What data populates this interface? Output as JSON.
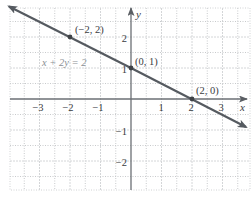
{
  "chart_data": {
    "type": "line",
    "title": "",
    "xlabel": "x",
    "ylabel": "y",
    "xlim": [
      -4,
      4
    ],
    "ylim": [
      -3,
      3
    ],
    "grid": true,
    "x_ticks": [
      -3,
      -2,
      -1,
      1,
      2,
      3
    ],
    "y_ticks": [
      2,
      1,
      -1,
      -2
    ],
    "x_tick_labels": [
      "−3",
      "−2",
      "−1",
      "1",
      "2",
      "3"
    ],
    "y_tick_labels": [
      "2",
      "1",
      "−1",
      "−2"
    ],
    "series": [
      {
        "name": "x + 2y = 2",
        "equation": "x + 2y = 2",
        "x": [
          -4,
          3.8
        ],
        "y": [
          3,
          -0.9
        ],
        "arrows": "both",
        "color": "#555a60"
      }
    ],
    "points": [
      {
        "x": -2,
        "y": 2,
        "label": "(−2, 2)"
      },
      {
        "x": 0,
        "y": 1,
        "label": "(0, 1)"
      },
      {
        "x": 2,
        "y": 0,
        "label": "(2, 0)"
      }
    ],
    "annotations": [
      {
        "text": "x + 2y = 2",
        "x": -3,
        "y": 1.2,
        "color": "#8a8f94"
      }
    ]
  },
  "labels": {
    "x_axis": "x",
    "y_axis": "y",
    "equation": "x + 2y = 2",
    "pt1": "(−2, 2)",
    "pt2": "(0, 1)",
    "pt3": "(2, 0)",
    "xt_m3": "−3",
    "xt_m2": "−2",
    "xt_m1": "−1",
    "xt_1": "1",
    "xt_2": "2",
    "xt_3": "3",
    "yt_2": "2",
    "yt_1": "1",
    "yt_m1": "−1",
    "yt_m2": "−2"
  },
  "colors": {
    "line": "#555a60",
    "axis": "#6b6f74",
    "grid_major": "#d4d6d8",
    "grid_minor": "#c8cacc",
    "text": "#3a3c3f",
    "equation_text": "#8a8f94"
  }
}
